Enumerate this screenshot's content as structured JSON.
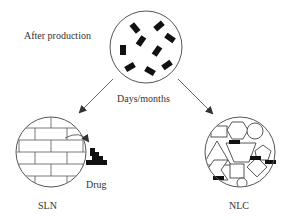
{
  "labels": {
    "after_production": "After production",
    "time_passage": "Days/months",
    "sln": "SLN",
    "nlc": "NLC",
    "drug": "Drug"
  },
  "nodes": [
    {
      "id": "initial",
      "description": "Nanoparticle with drug molecules dispersed",
      "label_key": "after_production"
    },
    {
      "id": "sln",
      "description": "Solid lipid nanoparticle with perfect crystal (brick) lattice expelling drug",
      "label_key": "sln"
    },
    {
      "id": "nlc",
      "description": "Nanostructured lipid carrier with imperfect matrix retaining drug",
      "label_key": "nlc"
    }
  ],
  "edges": [
    {
      "from": "initial",
      "to": "sln",
      "label_key": "time_passage"
    },
    {
      "from": "initial",
      "to": "nlc",
      "label_key": "time_passage"
    },
    {
      "from": "sln",
      "to": "drug",
      "type": "expulsion"
    }
  ],
  "colors": {
    "stroke": "#555555",
    "drug": "#111111",
    "text": "#333333",
    "background": "#ffffff"
  }
}
